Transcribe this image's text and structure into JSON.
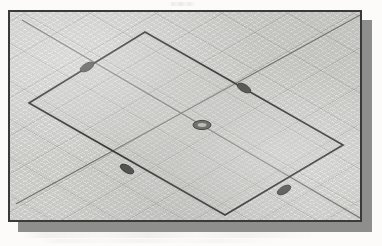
{
  "app": {
    "view_type": "isometric",
    "viewport_label": "graphics-viewport",
    "grid_visible": true,
    "grid_style": "isometric-crosshatch"
  },
  "colors": {
    "page_background": "#fcfbfa",
    "viewport_fill": "#c9c9c6",
    "viewport_border": "#3a3a38",
    "viewport_shadow": "#8e8e8c",
    "grid_line": "#787874",
    "axis_line": "#6d6d69",
    "sketch_edge": "#2d2d2b",
    "grip_fill": "#4a4a47",
    "grip_stroke": "#2a2a28"
  },
  "viewport": {
    "x": 8,
    "y": 10,
    "width": 354,
    "height": 212,
    "shadow_offset_x": 10,
    "shadow_offset_y": 10
  },
  "scene": {
    "axes": [
      {
        "name": "iso-axis-primary",
        "x1": 12,
        "y1": 8,
        "x2": 350,
        "y2": 206
      },
      {
        "name": "iso-axis-secondary",
        "x1": 6,
        "y1": 192,
        "x2": 352,
        "y2": 2
      }
    ],
    "sketch_rectangle": {
      "name": "rectangle-profile",
      "closed": true,
      "selected": true,
      "vertices": [
        {
          "label": "top",
          "x": 135,
          "y": 20
        },
        {
          "label": "right",
          "x": 333,
          "y": 133
        },
        {
          "label": "bottom",
          "x": 215,
          "y": 203
        },
        {
          "label": "left",
          "x": 19,
          "y": 91
        }
      ]
    },
    "grips": [
      {
        "label": "grip-edge-top-left",
        "x": 77,
        "y": 55,
        "rx": 7.5,
        "ry": 3.6,
        "rot": -30
      },
      {
        "label": "grip-edge-top-right",
        "x": 234,
        "y": 76,
        "rx": 7.5,
        "ry": 3.6,
        "rot": 30
      },
      {
        "label": "grip-edge-bottom-left",
        "x": 117,
        "y": 157,
        "rx": 7.5,
        "ry": 3.6,
        "rot": 30
      },
      {
        "label": "grip-edge-bottom-right",
        "x": 274,
        "y": 178,
        "rx": 7.5,
        "ry": 3.6,
        "rot": -30
      },
      {
        "label": "grip-center",
        "x": 192,
        "y": 113,
        "rx": 9.0,
        "ry": 4.6,
        "rot": 0
      }
    ],
    "grip_count": 5
  }
}
